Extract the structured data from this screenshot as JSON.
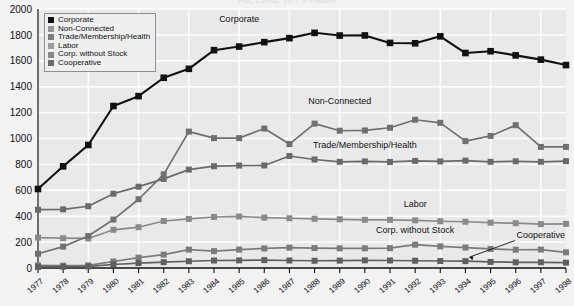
{
  "chart_data": {
    "type": "line",
    "title": "PAC Counts: 1977 to Present",
    "xlabel": "",
    "ylabel": "",
    "ylim": [
      0,
      2000
    ],
    "ytick_step": 200,
    "yticks": [
      0,
      200,
      400,
      600,
      800,
      1000,
      1200,
      1400,
      1600,
      1800,
      2000
    ],
    "grid": true,
    "legend_position": "top-left",
    "categories": [
      "1977",
      "1978",
      "1979",
      "1980",
      "1981",
      "1982",
      "1983",
      "1984",
      "1985",
      "1986",
      "1987",
      "1988",
      "1989",
      "1990",
      "1991",
      "1992",
      "1993",
      "1994",
      "1995",
      "1996",
      "1997",
      "1998"
    ],
    "series": [
      {
        "name": "Corporate",
        "color": "#111111",
        "values": [
          610,
          785,
          950,
          1251,
          1327,
          1469,
          1538,
          1682,
          1710,
          1744,
          1775,
          1816,
          1795,
          1796,
          1738,
          1735,
          1789,
          1660,
          1674,
          1642,
          1609,
          1567
        ]
      },
      {
        "name": "Non-Connected",
        "color": "#707070",
        "values": [
          110,
          165,
          247,
          374,
          531,
          723,
          1053,
          1003,
          1003,
          1077,
          957,
          1115,
          1060,
          1062,
          1083,
          1145,
          1121,
          980,
          1020,
          1103,
          935,
          935
        ]
      },
      {
        "name": "Trade/Membership/Health",
        "color": "#6a6a6a",
        "values": [
          450,
          453,
          477,
          574,
          628,
          688,
          760,
          786,
          791,
          792,
          865,
          838,
          820,
          823,
          819,
          827,
          823,
          829,
          820,
          824,
          820,
          825
        ]
      },
      {
        "name": "Labor",
        "color": "#8a8a8a",
        "values": [
          235,
          230,
          228,
          295,
          315,
          363,
          379,
          394,
          398,
          389,
          384,
          380,
          376,
          372,
          372,
          368,
          361,
          357,
          350,
          346,
          339,
          341
        ]
      },
      {
        "name": "Corp. without Stock",
        "color": "#7b7b7b",
        "values": [
          20,
          18,
          20,
          50,
          80,
          103,
          142,
          130,
          142,
          151,
          157,
          154,
          152,
          152,
          153,
          180,
          167,
          158,
          147,
          141,
          142,
          121
        ]
      },
      {
        "name": "Cooperative",
        "color": "#5f5f5f",
        "values": [
          8,
          10,
          12,
          27,
          38,
          45,
          52,
          58,
          59,
          61,
          58,
          56,
          57,
          59,
          58,
          56,
          54,
          53,
          47,
          44,
          44,
          41
        ]
      }
    ],
    "annotations": [
      {
        "text": "Corporate",
        "x_year": "1985",
        "value": 1900
      },
      {
        "text": "Non-Connected",
        "x_year": "1989",
        "value": 1270
      },
      {
        "text": "Trade/Membership/Health",
        "x_year": "1990",
        "value": 930
      },
      {
        "text": "Labor",
        "x_year": "1992",
        "value": 470
      },
      {
        "text": "Corp. without Stock",
        "x_year": "1992",
        "value": 270
      },
      {
        "text": "Cooperative",
        "x_year": "1997",
        "value": 235
      }
    ]
  },
  "legend": {
    "items": [
      {
        "label": "Corporate",
        "color": "#111111"
      },
      {
        "label": "Non-Connected",
        "color": "#949494"
      },
      {
        "label": "Trade/Membership/Health",
        "color": "#7c7c7c"
      },
      {
        "label": "Labor",
        "color": "#9c9c9c"
      },
      {
        "label": "Corp. without Stock",
        "color": "#878787"
      },
      {
        "label": "Cooperative",
        "color": "#6b6b6b"
      }
    ]
  },
  "style": {
    "plot_background": "#e9e9e9",
    "grid_color": "#ffffff",
    "axis_color": "#111111",
    "page_background": "#f2f2f2"
  }
}
